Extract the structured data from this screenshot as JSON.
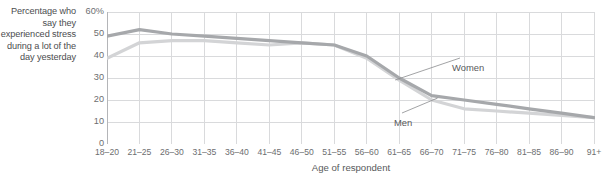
{
  "y_axis_caption": "Percentage who say they experienced stress during a lot of the day yesterday",
  "colors": {
    "women_line": "#a6a8ab",
    "men_line": "#d3d4d6",
    "grid": "#d9dadc",
    "axis": "#b4b5b8",
    "text": "#58595b",
    "tick_text": "#6d6e70"
  },
  "chart_data": {
    "type": "line",
    "title": "",
    "subtitle": "",
    "xlabel": "Age of respondent",
    "ylabel": "Percentage who say they experienced stress during a lot of the day yesterday",
    "ylim": [
      0,
      60
    ],
    "yticks": [
      0,
      10,
      20,
      30,
      40,
      50,
      60
    ],
    "ytick_labels": [
      "0",
      "10",
      "20",
      "30",
      "40",
      "50",
      "60%"
    ],
    "grid": true,
    "legend_position": "inline-annotations",
    "categories": [
      "18–20",
      "21–25",
      "26–30",
      "31–35",
      "36–40",
      "41–45",
      "46–50",
      "51–55",
      "56–60",
      "61–65",
      "66–70",
      "71–75",
      "76–80",
      "81–85",
      "86–90",
      "91+"
    ],
    "series": [
      {
        "name": "Women",
        "color": "#a6a8ab",
        "values": [
          49,
          52,
          50,
          49,
          48,
          47,
          46,
          45,
          40,
          30,
          22,
          20,
          18,
          16,
          14,
          12
        ]
      },
      {
        "name": "Men",
        "color": "#d3d4d6",
        "values": [
          39,
          46,
          47,
          47,
          46,
          45,
          46,
          45,
          39,
          29,
          20,
          16,
          15,
          14,
          13,
          12
        ]
      }
    ],
    "annotations": [
      {
        "text": "Women",
        "target_series": "Women",
        "target_category": "61–65"
      },
      {
        "text": "Men",
        "target_series": "Men",
        "target_category": "66–70"
      }
    ]
  }
}
